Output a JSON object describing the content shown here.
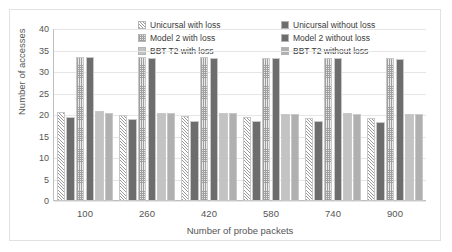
{
  "chart_data": {
    "type": "bar",
    "title": "",
    "xlabel": "Number of probe packets",
    "ylabel": "Number of accesses",
    "categories": [
      "100",
      "260",
      "420",
      "580",
      "740",
      "900"
    ],
    "ylim": [
      0,
      40
    ],
    "yticks": [
      "0",
      "5",
      "10",
      "15",
      "20",
      "25",
      "30",
      "35",
      "40"
    ],
    "grid": true,
    "legend_position": "top-center",
    "series": [
      {
        "name": "Unicursal with loss",
        "pattern": "diagonal-hatch",
        "color": "#f2f2f2",
        "values": [
          20.6,
          19.9,
          19.8,
          19.6,
          19.3,
          19.2
        ]
      },
      {
        "name": "Unicursal without loss",
        "pattern": "solid-dark",
        "color": "#6d6d6d",
        "values": [
          19.6,
          19.0,
          18.6,
          18.5,
          18.5,
          18.4
        ]
      },
      {
        "name": "Model 2 with loss",
        "pattern": "dotted-grid",
        "color": "#e9e9e9",
        "values": [
          33.5,
          33.4,
          33.4,
          33.3,
          33.3,
          33.2
        ]
      },
      {
        "name": "Model 2 without loss",
        "pattern": "solid-dark",
        "color": "#6d6d6d",
        "values": [
          33.6,
          33.3,
          33.3,
          33.3,
          33.2,
          33.1
        ]
      },
      {
        "name": "BBT T2 with loss",
        "pattern": "solid-light",
        "color": "#c3c3c3",
        "values": [
          20.9,
          20.5,
          20.5,
          20.3,
          20.5,
          20.3
        ]
      },
      {
        "name": "BBT T2 without loss",
        "pattern": "solid-mid",
        "color": "#b0b0b0",
        "values": [
          20.5,
          20.4,
          20.4,
          20.2,
          20.3,
          20.2
        ]
      }
    ]
  },
  "legend": {
    "items": [
      {
        "label": "Unicursal with loss",
        "swatch": "diagonal-hatch"
      },
      {
        "label": "Unicursal without loss",
        "swatch": "solid-dark"
      },
      {
        "label": "Model 2 with loss",
        "swatch": "dotted-grid"
      },
      {
        "label": "Model 2 without loss",
        "swatch": "solid-dark"
      },
      {
        "label": "BBT T2 with loss",
        "swatch": "solid-light"
      },
      {
        "label": "BBT T2 without loss",
        "swatch": "solid-mid"
      }
    ]
  }
}
